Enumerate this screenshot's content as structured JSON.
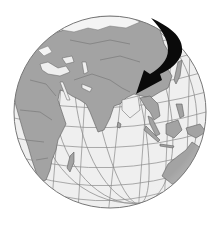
{
  "figure": {
    "subject": "Globe centered on Asia and the Indian Ocean with a curved black arrow pointing toward Southeast Asia",
    "colors": {
      "background": "#ffffff",
      "ocean": "#efefef",
      "land": "#a3a3a3",
      "land_border": "#5e5e5e",
      "graticule": "#8a8a8a",
      "ice": "#f4f4f4",
      "arrow": "#0a0a0a",
      "globe_outline": "#777777"
    },
    "globe": {
      "cx": 110,
      "cy": 112,
      "r": 96
    },
    "arrow": {
      "start": [
        151,
        18
      ],
      "tip": [
        136,
        94
      ],
      "direction": "clockwise-down-left"
    },
    "regions_visible": [
      "Europe",
      "Africa",
      "Middle East",
      "India",
      "China",
      "Southeast Asia",
      "Australia",
      "Madagascar",
      "Indian Ocean",
      "Arctic ice"
    ]
  }
}
